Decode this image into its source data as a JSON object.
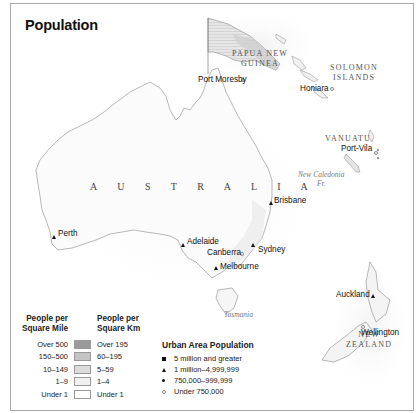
{
  "map": {
    "title": "Population",
    "countries": {
      "australia": "A U S T R A L I A",
      "papua_new_guinea_1": "PAPUA NEW",
      "papua_new_guinea_2": "GUINEA",
      "solomon_1": "SOLOMON",
      "solomon_2": "ISLANDS",
      "vanuatu": "VANUATU",
      "new_zealand_1": "NEW",
      "new_zealand_2": "ZEALAND"
    },
    "regions": {
      "new_caledonia_1": "New Caledonia",
      "new_caledonia_2": "Fr.",
      "tasmania": "Tasmania"
    },
    "cities": [
      {
        "name": "Port Moresby",
        "marker": "under-750k"
      },
      {
        "name": "Honiara",
        "marker": "under-750k"
      },
      {
        "name": "Port-Vila",
        "marker": "under-750k"
      },
      {
        "name": "Brisbane",
        "marker": "1m-4.99m"
      },
      {
        "name": "Perth",
        "marker": "1m-4.99m"
      },
      {
        "name": "Adelaide",
        "marker": "1m-4.99m"
      },
      {
        "name": "Canberra",
        "marker": "under-750k"
      },
      {
        "name": "Sydney",
        "marker": "1m-4.99m"
      },
      {
        "name": "Melbourne",
        "marker": "1m-4.99m"
      },
      {
        "name": "Auckland",
        "marker": "1m-4.99m"
      },
      {
        "name": "Wellington",
        "marker": "under-750k"
      }
    ]
  },
  "legend_density": {
    "header_mile_1": "People per",
    "header_mile_2": "Square Mile",
    "header_km_1": "People per",
    "header_km_2": "Square Km",
    "rows": [
      {
        "per_mile": "Over 500",
        "per_km": "Over 195",
        "color": "#9a9a9a"
      },
      {
        "per_mile": "150–500",
        "per_km": "60–195",
        "color": "#c4c4c4"
      },
      {
        "per_mile": "10–149",
        "per_km": "5–59",
        "color": "#dcdcdc"
      },
      {
        "per_mile": "1–9",
        "per_km": "1–4",
        "color": "#f0f0f0"
      },
      {
        "per_mile": "Under 1",
        "per_km": "Under 1",
        "color": "#ffffff"
      }
    ]
  },
  "legend_urban": {
    "title": "Urban Area Population",
    "items": [
      {
        "label": "5 million and greater",
        "marker": "square"
      },
      {
        "label": "1 million–4,999,999",
        "marker": "triangle"
      },
      {
        "label": "750,000–999,999",
        "marker": "dot"
      },
      {
        "label": "Under 750,000",
        "marker": "circle"
      }
    ]
  }
}
